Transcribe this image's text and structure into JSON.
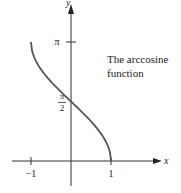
{
  "chart_data": {
    "type": "line",
    "title": "",
    "annotation": [
      "The arccosine",
      "function"
    ],
    "xlabel": "x",
    "ylabel": "y",
    "xlim": [
      -1.3,
      3.4
    ],
    "ylim": [
      -0.9,
      4.2
    ],
    "x_ticks": [
      {
        "value": -1,
        "label": "−1"
      },
      {
        "value": 1,
        "label": "1"
      }
    ],
    "y_ticks": [
      {
        "value": 3.14159,
        "label": "π"
      },
      {
        "value": 1.5708,
        "label": "π/2",
        "num": "π",
        "den": "2"
      }
    ],
    "series": [
      {
        "name": "arccos(x)",
        "function": "arccos",
        "domain": [
          -1,
          1
        ],
        "color": "#555555"
      }
    ],
    "grid": false,
    "legend": "none"
  }
}
